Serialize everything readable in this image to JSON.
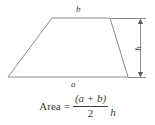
{
  "figure": {
    "type": "geometry-diagram",
    "shape": "trapezoid",
    "background_color": "#ffffff",
    "stroke_color": "#8a8a8a",
    "text_color": "#3a3a3a",
    "labels": {
      "top_side": "b",
      "bottom_side": "a",
      "height": "h"
    },
    "dimension": {
      "name": "height-dimension",
      "orientation": "vertical",
      "arrowheads": "both"
    },
    "vertices": {
      "top_left": [
        52,
        18
      ],
      "top_right": [
        110,
        18
      ],
      "bottom_right": [
        128,
        77
      ],
      "bottom_left": [
        8,
        77
      ]
    }
  },
  "formula": {
    "lhs": "Area",
    "equals": "=",
    "numerator": "(a + b)",
    "denominator": "2",
    "trailing": "h",
    "plain_text": "Area = (a + b) / 2 · h"
  }
}
